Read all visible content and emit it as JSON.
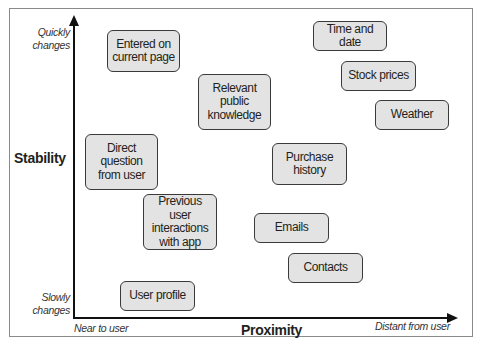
{
  "diagram": {
    "type": "quadrant-scatter",
    "y_axis": {
      "title": "Stability",
      "top_label": "Quickly changes",
      "bottom_label": "Slowly changes"
    },
    "x_axis": {
      "title": "Proximity",
      "left_label": "Near to user",
      "right_label": "Distant from user"
    },
    "nodes": [
      {
        "id": "entered-on-current-page",
        "label": "Entered on current page"
      },
      {
        "id": "relevant-public-knowledge",
        "label": "Relevant public knowledge"
      },
      {
        "id": "time-and-date",
        "label": "Time and date"
      },
      {
        "id": "stock-prices",
        "label": "Stock prices"
      },
      {
        "id": "weather",
        "label": "Weather"
      },
      {
        "id": "direct-question-from-user",
        "label": "Direct question from user"
      },
      {
        "id": "purchase-history",
        "label": "Purchase history"
      },
      {
        "id": "previous-user-interactions",
        "label": "Previous user interactions with app"
      },
      {
        "id": "emails",
        "label": "Emails"
      },
      {
        "id": "contacts",
        "label": "Contacts"
      },
      {
        "id": "user-profile",
        "label": "User profile"
      }
    ],
    "colors": {
      "node_fill": "#e3e3e3",
      "node_border": "#3a3a3a",
      "axis": "#111111",
      "frame": "#8a8a8a"
    }
  }
}
